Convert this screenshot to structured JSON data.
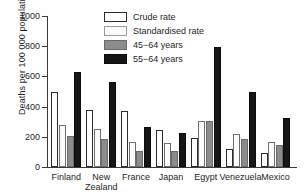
{
  "chart_data": {
    "type": "bar",
    "title": "",
    "xlabel": "",
    "ylabel": "Deaths per 100 000 population",
    "ylim": [
      0,
      1000
    ],
    "yticks": [
      0,
      200,
      400,
      600,
      800,
      1000
    ],
    "grid": false,
    "legend_position": "top-center",
    "categories": [
      "Finland",
      "New Zealand",
      "France",
      "Japan",
      "Egypt",
      "Venezuela",
      "Mexico"
    ],
    "category_lines": [
      [
        "Finland"
      ],
      [
        "New",
        "Zealand"
      ],
      [
        "France"
      ],
      [
        "Japan"
      ],
      [
        "Egypt"
      ],
      [
        "Venezuela"
      ],
      [
        "Mexico"
      ]
    ],
    "series": [
      {
        "name": "Crude rate",
        "color": "#ffffff",
        "values": [
          495,
          375,
          368,
          247,
          192,
          120,
          95
        ]
      },
      {
        "name": "Standardised rate",
        "color": "#fbfbfb",
        "values": [
          280,
          255,
          165,
          158,
          307,
          218,
          165
        ]
      },
      {
        "name": "45−64 years",
        "color": "#8c8c8c",
        "values": [
          203,
          188,
          105,
          103,
          307,
          188,
          145
        ]
      },
      {
        "name": "55−64 years",
        "color": "#161616",
        "values": [
          630,
          560,
          265,
          228,
          795,
          500,
          325
        ]
      }
    ]
  },
  "legend": {
    "items": [
      {
        "label": "Crude rate",
        "swatch": "crude"
      },
      {
        "label": "Standardised rate",
        "swatch": "standardised"
      },
      {
        "label": "45−64 years",
        "swatch": "mid"
      },
      {
        "label": "55−64 years",
        "swatch": "old"
      }
    ]
  }
}
